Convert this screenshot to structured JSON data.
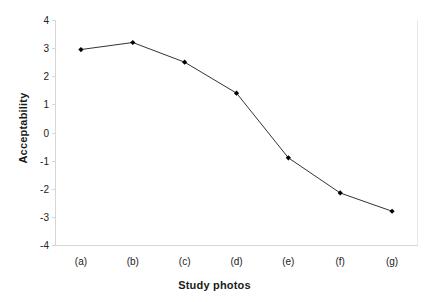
{
  "chart_data": {
    "type": "line",
    "title": "",
    "xlabel": "Study photos",
    "ylabel": "Acceptability",
    "categories": [
      "(a)",
      "(b)",
      "(c)",
      "(d)",
      "(e)",
      "(f)",
      "(g)"
    ],
    "values": [
      2.95,
      3.2,
      2.5,
      1.4,
      -0.9,
      -2.15,
      -2.8
    ],
    "series": [
      {
        "name": "Acceptability",
        "values": [
          2.95,
          3.2,
          2.5,
          1.4,
          -0.9,
          -2.15,
          -2.8
        ]
      }
    ],
    "ylim": [
      -4,
      4
    ],
    "y_ticks": [
      4,
      3,
      2,
      1,
      0,
      -1,
      -2,
      -3,
      -4
    ],
    "y_tick_labels": [
      "4",
      "3",
      "2",
      "1",
      "0",
      "-1",
      "-2",
      "-3",
      "-4"
    ],
    "grid": false,
    "legend": "none",
    "marker": "diamond",
    "line_color": "#333333",
    "marker_color": "#000000"
  },
  "axes": {
    "y_title": "Acceptability",
    "x_title": "Study photos"
  }
}
